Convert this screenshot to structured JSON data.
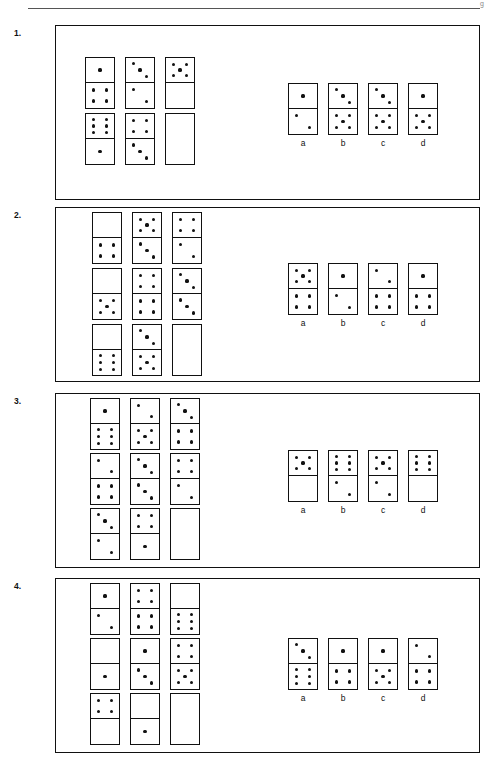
{
  "page": {
    "header_rule": true,
    "header_mark": "g"
  },
  "domino_style": {
    "width": 30,
    "height": 52,
    "pip_diameter": 3.2,
    "border_color": "#111111",
    "pip_color": "#111111",
    "background": "#ffffff"
  },
  "questions": [
    {
      "number": "1.",
      "frame": {
        "x": 55,
        "y": 25,
        "w": 425,
        "h": 175
      },
      "grid": {
        "x": 85,
        "y": 57,
        "cols": 3,
        "rows": 2,
        "col_gap": 10,
        "row_gap": 4
      },
      "matrix": [
        [
          {
            "top": 1,
            "bottom": 4
          },
          {
            "top": 3,
            "bottom": 2
          },
          {
            "top": 5,
            "bottom": 0
          }
        ],
        [
          {
            "top": 6,
            "bottom": 1
          },
          {
            "top": 4,
            "bottom": 3
          },
          {
            "empty": true
          }
        ]
      ],
      "options": {
        "x": 288,
        "y": 83,
        "gap": 10
      },
      "choices": [
        {
          "label": "a",
          "top": 1,
          "bottom": 2
        },
        {
          "label": "b",
          "top": 3,
          "bottom": 5
        },
        {
          "label": "c",
          "top": 3,
          "bottom": 5
        },
        {
          "label": "d",
          "top": 1,
          "bottom": 5
        }
      ]
    },
    {
      "number": "2.",
      "frame": {
        "x": 55,
        "y": 207,
        "w": 425,
        "h": 175
      },
      "grid": {
        "x": 92,
        "y": 212,
        "cols": 3,
        "rows": 3,
        "col_gap": 10,
        "row_gap": 4
      },
      "matrix": [
        [
          {
            "top": 0,
            "bottom": 4
          },
          {
            "top": 5,
            "bottom": 3
          },
          {
            "top": 4,
            "bottom": 2
          }
        ],
        [
          {
            "top": 0,
            "bottom": 5
          },
          {
            "top": 4,
            "bottom": 4
          },
          {
            "top": 3,
            "bottom": 3
          }
        ],
        [
          {
            "top": 0,
            "bottom": 6
          },
          {
            "top": 3,
            "bottom": 5
          },
          {
            "empty": true
          }
        ]
      ],
      "options": {
        "x": 288,
        "y": 263,
        "gap": 10
      },
      "choices": [
        {
          "label": "a",
          "top": 5,
          "bottom": 4
        },
        {
          "label": "b",
          "top": 1,
          "bottom": 2
        },
        {
          "label": "c",
          "top": 2,
          "bottom": 4
        },
        {
          "label": "d",
          "top": 1,
          "bottom": 4
        }
      ]
    },
    {
      "number": "3.",
      "frame": {
        "x": 55,
        "y": 393,
        "w": 425,
        "h": 175
      },
      "grid": {
        "x": 90,
        "y": 398,
        "cols": 3,
        "rows": 3,
        "col_gap": 10,
        "row_gap": 3
      },
      "matrix": [
        [
          {
            "top": 1,
            "bottom": 6
          },
          {
            "top": 2,
            "bottom": 5
          },
          {
            "top": 3,
            "bottom": 4
          }
        ],
        [
          {
            "top": 2,
            "bottom": 4
          },
          {
            "top": 3,
            "bottom": 3
          },
          {
            "top": 4,
            "bottom": 2
          }
        ],
        [
          {
            "top": 3,
            "bottom": 2
          },
          {
            "top": 4,
            "bottom": 1
          },
          {
            "empty": true
          }
        ]
      ],
      "options": {
        "x": 288,
        "y": 450,
        "gap": 10
      },
      "choices": [
        {
          "label": "a",
          "top": 5,
          "bottom": 0
        },
        {
          "label": "b",
          "top": 6,
          "bottom": 2
        },
        {
          "label": "c",
          "top": 5,
          "bottom": 2
        },
        {
          "label": "d",
          "top": 6,
          "bottom": 0
        }
      ]
    },
    {
      "number": "4.",
      "frame": {
        "x": 55,
        "y": 578,
        "w": 425,
        "h": 175
      },
      "grid": {
        "x": 90,
        "y": 583,
        "cols": 3,
        "rows": 3,
        "col_gap": 10,
        "row_gap": 3
      },
      "matrix": [
        [
          {
            "top": 1,
            "bottom": 2
          },
          {
            "top": 4,
            "bottom": 4
          },
          {
            "top": 0,
            "bottom": 6
          }
        ],
        [
          {
            "top": 0,
            "bottom": 1
          },
          {
            "top": 1,
            "bottom": 3
          },
          {
            "top": 4,
            "bottom": 5
          }
        ],
        [
          {
            "top": 4,
            "bottom": 0
          },
          {
            "top": 0,
            "bottom": 1
          },
          {
            "empty": true
          }
        ]
      ],
      "options": {
        "x": 288,
        "y": 638,
        "gap": 10
      },
      "choices": [
        {
          "label": "a",
          "top": 3,
          "bottom": 6
        },
        {
          "label": "b",
          "top": 1,
          "bottom": 4
        },
        {
          "label": "c",
          "top": 1,
          "bottom": 5
        },
        {
          "label": "d",
          "top": 2,
          "bottom": 4
        }
      ]
    }
  ]
}
